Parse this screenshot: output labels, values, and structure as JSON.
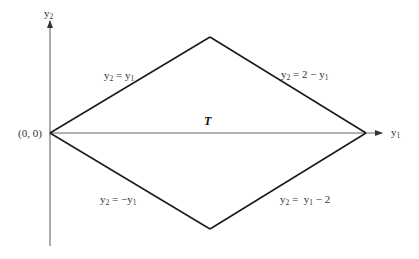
{
  "diagram": {
    "axes": {
      "x_axis": {
        "var": "y",
        "sub": "1"
      },
      "y_axis": {
        "var": "y",
        "sub": "2"
      }
    },
    "origin_label": "(0, 0)",
    "region_label": "T",
    "edges": [
      {
        "id": "upper-left",
        "lhs_var": "y",
        "lhs_sub": "2",
        "eq": " = ",
        "rhs_var": "y",
        "rhs_sub": "1",
        "rhs_prefix": "",
        "rhs_suffix": ""
      },
      {
        "id": "upper-right",
        "lhs_var": "y",
        "lhs_sub": "2",
        "eq": " = ",
        "rhs_prefix": "2 − ",
        "rhs_var": "y",
        "rhs_sub": "1",
        "rhs_suffix": ""
      },
      {
        "id": "lower-left",
        "lhs_var": "y",
        "lhs_sub": "2",
        "eq": " = ",
        "rhs_prefix": "−",
        "rhs_var": "y",
        "rhs_sub": "1",
        "rhs_suffix": ""
      },
      {
        "id": "lower-right",
        "lhs_var": "y",
        "lhs_sub": "2",
        "eq": " =  ",
        "rhs_prefix": "",
        "rhs_var": "y",
        "rhs_sub": "1",
        "rhs_suffix": " − 2"
      }
    ],
    "vertices": [
      {
        "name": "left",
        "coords": "(0, 0)"
      },
      {
        "name": "top",
        "coords": "(1, 1)"
      },
      {
        "name": "right",
        "coords": "(2, 0)"
      },
      {
        "name": "bottom",
        "coords": "(1, -1)"
      }
    ],
    "colors": {
      "line": "#1a1a1a",
      "axis": "#555555",
      "text": "#333333"
    }
  }
}
